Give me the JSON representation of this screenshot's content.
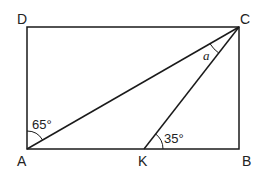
{
  "diagram": {
    "type": "geometry",
    "shape": "rectangle ABCD with segments AC and KC",
    "points": {
      "A": {
        "label": "A",
        "x": 27,
        "y": 149
      },
      "B": {
        "label": "B",
        "x": 239,
        "y": 149
      },
      "C": {
        "label": "C",
        "x": 239,
        "y": 27
      },
      "D": {
        "label": "D",
        "x": 27,
        "y": 27
      },
      "K": {
        "label": "K",
        "x": 144,
        "y": 149
      }
    },
    "segments": [
      "AB",
      "BC",
      "CD",
      "DA",
      "AC",
      "KC"
    ],
    "angles": [
      {
        "at": "A",
        "between": "AD-AC",
        "label": "65°"
      },
      {
        "at": "K",
        "between": "KB-KC",
        "label": "35°"
      },
      {
        "at": "C",
        "between": "CA-CK",
        "label": "a"
      }
    ],
    "stroke_color": "#1a1a1a"
  }
}
